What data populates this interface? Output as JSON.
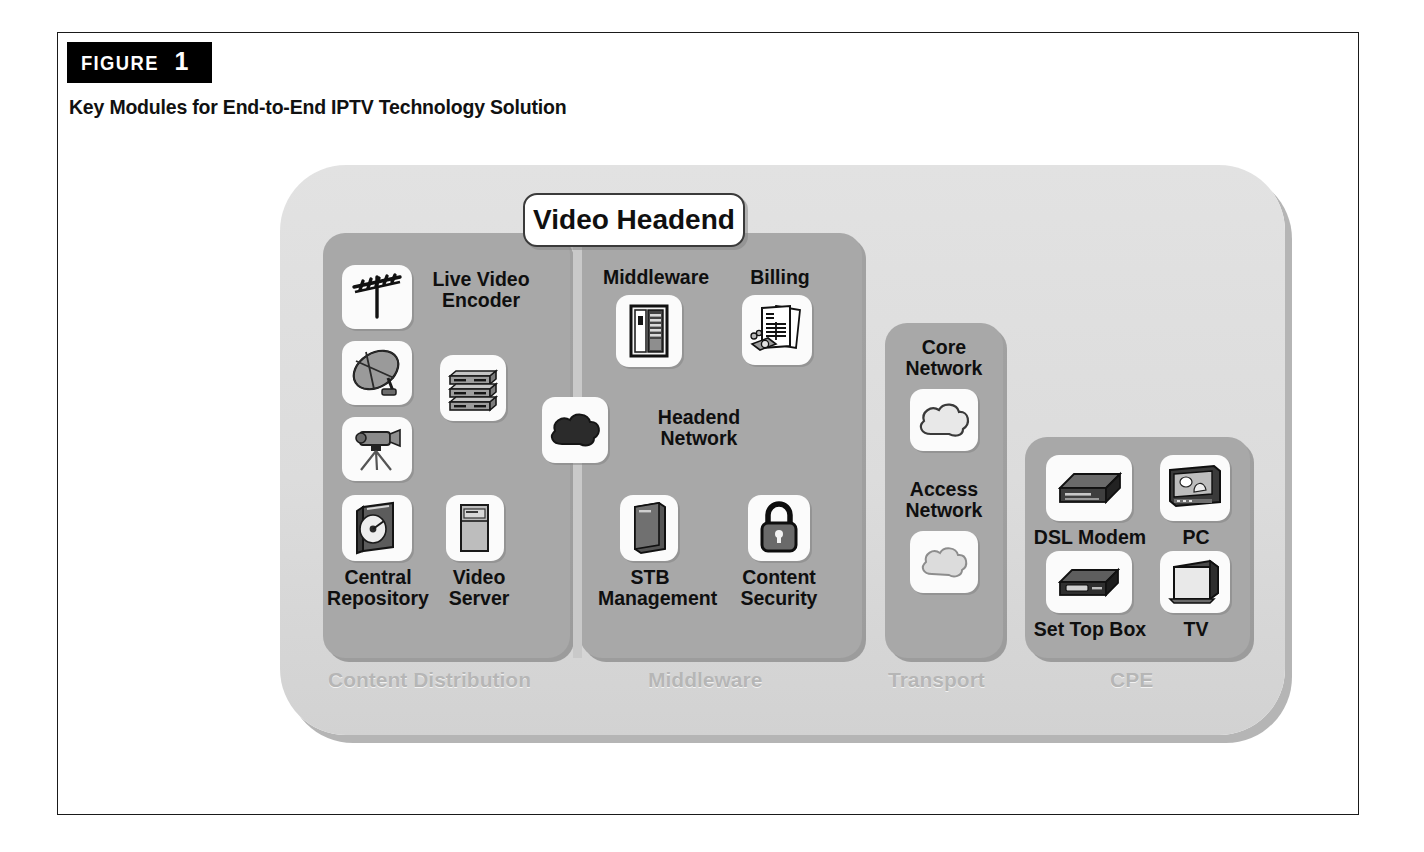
{
  "figure": {
    "tag_word": "FIGURE",
    "tag_number": "1",
    "title": "Key Modules for End-to-End IPTV Technology Solution"
  },
  "diagram": {
    "badge": {
      "label": "Video Headend"
    },
    "groups": [
      {
        "key": "content_distribution",
        "caption": "Content Distribution"
      },
      {
        "key": "middleware",
        "caption": "Middleware"
      },
      {
        "key": "transport",
        "caption": "Transport"
      },
      {
        "key": "cpe",
        "caption": "CPE"
      }
    ],
    "nodes": {
      "antenna": {
        "label": "",
        "icon": "antenna-icon"
      },
      "satellite": {
        "label": "",
        "icon": "satellite-dish-icon"
      },
      "camera": {
        "label": "",
        "icon": "video-camera-icon"
      },
      "live_video_encoder": {
        "label": "Live Video\nEncoder",
        "icon": "rack-servers-icon"
      },
      "central_repository": {
        "label": "Central\nRepository",
        "icon": "disc-storage-icon"
      },
      "video_server": {
        "label": "Video\nServer",
        "icon": "server-tower-icon"
      },
      "middleware": {
        "label": "Middleware",
        "icon": "middleware-cabinet-icon"
      },
      "billing": {
        "label": "Billing",
        "icon": "invoice-money-icon"
      },
      "headend_network": {
        "label": "Headend\nNetwork",
        "icon": "dark-cloud-icon"
      },
      "stb_management": {
        "label": "STB\nManagement",
        "icon": "server-tower-icon"
      },
      "content_security": {
        "label": "Content\nSecurity",
        "icon": "padlock-icon"
      },
      "core_network": {
        "label": "Core\nNetwork",
        "icon": "cloud-icon"
      },
      "access_network": {
        "label": "Access\nNetwork",
        "icon": "cloud-icon"
      },
      "dsl_modem": {
        "label": "DSL Modem",
        "icon": "modem-icon"
      },
      "pc": {
        "label": "PC",
        "icon": "desktop-computer-icon"
      },
      "set_top_box": {
        "label": "Set Top Box",
        "icon": "set-top-box-icon"
      },
      "tv": {
        "label": "TV",
        "icon": "television-icon"
      }
    },
    "colors": {
      "canvas": "#dcdcdc",
      "group": "#a8a8a8",
      "tile": "#fbfbfb",
      "caption": "#b6b6b6",
      "text": "#0f0f0f",
      "tag_background": "#000000"
    }
  }
}
